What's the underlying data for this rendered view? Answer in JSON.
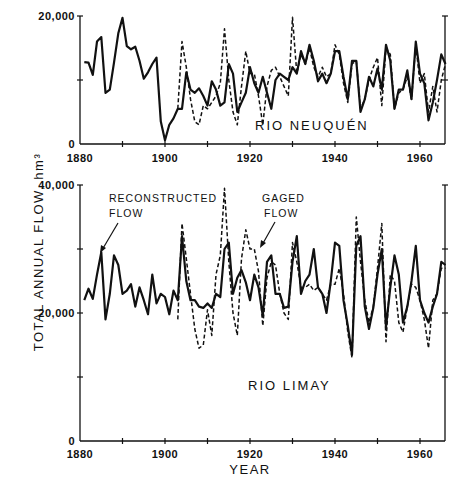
{
  "figure": {
    "ylabel": "TOTAL ANNUAL FLOW, hm³",
    "xlabel": "YEAR",
    "legend_reconstructed": "RECONSTRUCTED",
    "legend_reconstructed_2": "FLOW",
    "legend_gaged": "GAGED",
    "legend_gaged_2": "FLOW"
  },
  "panels": {
    "top": {
      "title": "RIO NEUQUÉN",
      "yticks": [
        "0",
        "20,000"
      ],
      "xticks": [
        "1880",
        "1900",
        "1920",
        "1940",
        "1960"
      ]
    },
    "bottom": {
      "title": "RIO LIMAY",
      "yticks": [
        "0",
        "20,000",
        "40,000"
      ],
      "xticks": [
        "1880",
        "1900",
        "1920",
        "1940",
        "1960"
      ]
    }
  },
  "chart_data": [
    {
      "type": "line",
      "title": "RIO NEUQUÉN",
      "xlabel": "YEAR",
      "ylabel": "TOTAL ANNUAL FLOW, hm³",
      "xlim": [
        1880,
        1966
      ],
      "ylim": [
        0,
        20000
      ],
      "grid": false,
      "series": [
        {
          "name": "Reconstructed flow",
          "style": "solid",
          "x": [
            1881,
            1882,
            1883,
            1884,
            1885,
            1886,
            1887,
            1888,
            1889,
            1890,
            1891,
            1892,
            1893,
            1894,
            1895,
            1896,
            1897,
            1898,
            1899,
            1900,
            1901,
            1902,
            1903,
            1904,
            1905,
            1906,
            1907,
            1908,
            1909,
            1910,
            1911,
            1912,
            1913,
            1914,
            1915,
            1916,
            1917,
            1918,
            1919,
            1920,
            1921,
            1922,
            1923,
            1924,
            1925,
            1926,
            1927,
            1928,
            1929,
            1930,
            1931,
            1932,
            1933,
            1934,
            1935,
            1936,
            1937,
            1938,
            1939,
            1940,
            1941,
            1942,
            1943,
            1944,
            1945,
            1946,
            1947,
            1948,
            1949,
            1950,
            1951,
            1952,
            1953,
            1954,
            1955,
            1956,
            1957,
            1958,
            1959,
            1960,
            1961,
            1962,
            1963,
            1964,
            1965,
            1966
          ],
          "values": [
            12800,
            12700,
            10800,
            16000,
            16700,
            8000,
            8500,
            12700,
            17300,
            19700,
            15300,
            14800,
            15200,
            13000,
            10200,
            11200,
            12500,
            13500,
            3500,
            600,
            3000,
            4000,
            5500,
            5500,
            11200,
            8500,
            8000,
            8700,
            7500,
            6000,
            9800,
            8500,
            6000,
            6500,
            12500,
            11000,
            5000,
            6500,
            8000,
            12000,
            9500,
            8000,
            10500,
            8000,
            5500,
            10000,
            11000,
            10500,
            10000,
            12000,
            11000,
            14500,
            12500,
            15500,
            13000,
            9800,
            11000,
            9500,
            11000,
            14500,
            14500,
            10500,
            7000,
            13000,
            13000,
            5000,
            7000,
            10500,
            9000,
            11800,
            8500,
            15500,
            13000,
            5500,
            8500,
            8500,
            11500,
            7000,
            16000,
            11000,
            9500,
            3700,
            6500,
            10000,
            14000,
            12500
          ]
        },
        {
          "name": "Gaged flow",
          "style": "dashed",
          "x": [
            1903,
            1904,
            1905,
            1906,
            1907,
            1908,
            1909,
            1910,
            1911,
            1912,
            1913,
            1914,
            1915,
            1916,
            1917,
            1918,
            1919,
            1920,
            1921,
            1922,
            1923,
            1924,
            1925,
            1926,
            1927,
            1928,
            1929,
            1930,
            1931,
            1932,
            1933,
            1934,
            1935,
            1936,
            1937,
            1938,
            1939,
            1940,
            1941,
            1942,
            1943,
            1944,
            1945,
            1946,
            1947,
            1948,
            1949,
            1950,
            1951,
            1952,
            1953,
            1954,
            1955,
            1956,
            1957,
            1958,
            1959,
            1960,
            1961,
            1962,
            1963,
            1964,
            1965,
            1966
          ],
          "values": [
            5500,
            16000,
            12000,
            7000,
            3500,
            3000,
            6000,
            5500,
            6500,
            7500,
            9500,
            18000,
            10000,
            5000,
            3000,
            9000,
            14500,
            11000,
            11000,
            7500,
            3000,
            9000,
            11500,
            12000,
            10500,
            9000,
            7500,
            19800,
            11000,
            14000,
            12500,
            15000,
            12000,
            10500,
            12000,
            10500,
            11000,
            15500,
            14000,
            9500,
            6500,
            12500,
            13000,
            5500,
            7000,
            10000,
            12000,
            13500,
            6000,
            15000,
            14000,
            5500,
            8000,
            8500,
            10500,
            7000,
            15500,
            9500,
            11000,
            5000,
            9000,
            5000,
            10000,
            12500
          ]
        }
      ]
    },
    {
      "type": "line",
      "title": "RIO LIMAY",
      "xlabel": "YEAR",
      "ylabel": "TOTAL ANNUAL FLOW, hm³",
      "xlim": [
        1880,
        1966
      ],
      "ylim": [
        0,
        40000
      ],
      "grid": false,
      "series": [
        {
          "name": "Reconstructed flow",
          "style": "solid",
          "x": [
            1881,
            1882,
            1883,
            1884,
            1885,
            1886,
            1887,
            1888,
            1889,
            1890,
            1891,
            1892,
            1893,
            1894,
            1895,
            1896,
            1897,
            1898,
            1899,
            1900,
            1901,
            1902,
            1903,
            1904,
            1905,
            1906,
            1907,
            1908,
            1909,
            1910,
            1911,
            1912,
            1913,
            1914,
            1915,
            1916,
            1917,
            1918,
            1919,
            1920,
            1921,
            1922,
            1923,
            1924,
            1925,
            1926,
            1927,
            1928,
            1929,
            1930,
            1931,
            1932,
            1933,
            1934,
            1935,
            1936,
            1937,
            1938,
            1939,
            1940,
            1941,
            1942,
            1943,
            1944,
            1945,
            1946,
            1947,
            1948,
            1949,
            1950,
            1951,
            1952,
            1953,
            1954,
            1955,
            1956,
            1957,
            1958,
            1959,
            1960,
            1961,
            1962,
            1963,
            1964,
            1965,
            1966
          ],
          "values": [
            22000,
            23800,
            22200,
            26000,
            29500,
            19000,
            23000,
            29000,
            27500,
            23000,
            23500,
            24500,
            21000,
            24000,
            22000,
            19800,
            26000,
            21500,
            23000,
            22500,
            19800,
            23500,
            22000,
            32000,
            25000,
            22000,
            22000,
            21000,
            20800,
            21500,
            20800,
            23000,
            22500,
            30000,
            31000,
            23000,
            25500,
            26700,
            24800,
            22000,
            26000,
            24000,
            19500,
            28000,
            29000,
            23000,
            23000,
            20800,
            21000,
            28000,
            32000,
            23000,
            25000,
            26000,
            30000,
            24000,
            23000,
            20000,
            25000,
            31000,
            30500,
            22000,
            18000,
            13500,
            30500,
            32000,
            21000,
            17500,
            20800,
            26000,
            30000,
            17800,
            24000,
            29000,
            26000,
            18500,
            21000,
            25000,
            30500,
            22000,
            20000,
            18500,
            21000,
            23000,
            28000,
            27500
          ]
        },
        {
          "name": "Gaged flow",
          "style": "dashed",
          "x": [
            1903,
            1904,
            1905,
            1906,
            1907,
            1908,
            1909,
            1910,
            1911,
            1912,
            1913,
            1914,
            1915,
            1916,
            1917,
            1918,
            1919,
            1920,
            1921,
            1922,
            1923,
            1924,
            1925,
            1926,
            1927,
            1928,
            1929,
            1930,
            1931,
            1932,
            1933,
            1934,
            1935,
            1936,
            1937,
            1938,
            1939,
            1940,
            1941,
            1942,
            1943,
            1944,
            1945,
            1946,
            1947,
            1948,
            1949,
            1950,
            1951,
            1952,
            1953,
            1954,
            1955,
            1956,
            1957,
            1958,
            1959,
            1960,
            1961,
            1962,
            1963,
            1964,
            1965,
            1966
          ],
          "values": [
            19000,
            34000,
            28500,
            23000,
            17500,
            14500,
            15000,
            20500,
            16500,
            26000,
            29000,
            39500,
            28000,
            20000,
            16500,
            28500,
            33000,
            30000,
            30000,
            26500,
            18000,
            25500,
            28000,
            27500,
            23000,
            20000,
            19000,
            31000,
            28000,
            24000,
            24000,
            24500,
            23500,
            24000,
            23000,
            22000,
            24500,
            24500,
            27000,
            23000,
            17000,
            13000,
            35000,
            28000,
            22000,
            18500,
            21000,
            27000,
            34000,
            15500,
            26000,
            25000,
            18500,
            17000,
            21000,
            24500,
            24000,
            22000,
            19000,
            14500,
            22000,
            23000,
            27000,
            27000
          ]
        }
      ]
    }
  ]
}
